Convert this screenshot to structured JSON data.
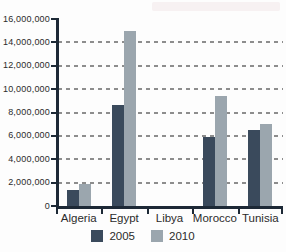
{
  "figure": {
    "background_color": "#fdfdfd",
    "axis_color": "#1d2936",
    "gridline_color": "#8d8d8d",
    "text_color": "#2b2b2b"
  },
  "legend": {
    "items": [
      {
        "label": "2005",
        "color": "#3a4a5c"
      },
      {
        "label": "2010",
        "color": "#9ba6ae"
      }
    ]
  },
  "chart_data": {
    "type": "bar",
    "title": "",
    "xlabel": "",
    "ylabel": "",
    "categories": [
      "Algeria",
      "Egypt",
      "Libya",
      "Morocco",
      "Tunisia"
    ],
    "series": [
      {
        "name": "2005",
        "color": "#3a4a5c",
        "values": [
          1400000,
          8600000,
          0,
          5900000,
          6500000
        ]
      },
      {
        "name": "2010",
        "color": "#9ba6ae",
        "values": [
          1900000,
          15000000,
          0,
          9400000,
          7000000
        ]
      }
    ],
    "ylim": [
      0,
      16000000
    ],
    "ytick_step": 2000000,
    "ytick_labels": [
      "0",
      "2,000,000",
      "4,000,000",
      "6,000,000",
      "8,000,000",
      "10,000,000",
      "12,000,000",
      "14,000,000",
      "16,000,000"
    ],
    "grid": "horizontal-dashed",
    "gridline_values": [
      2000000,
      4000000,
      6000000,
      8000000,
      10000000,
      12000000,
      14000000
    ],
    "legend_position": "bottom-center"
  }
}
